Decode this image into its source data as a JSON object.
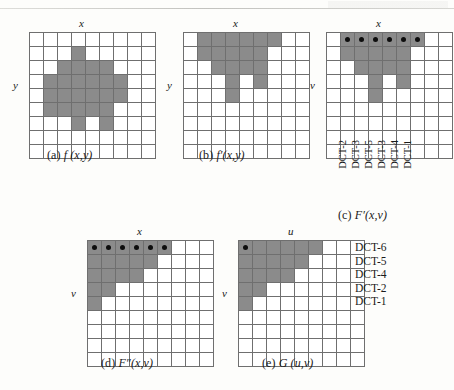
{
  "figure": {
    "fill_color": "#8b8b8b",
    "grid_line_color": "#6f6f6f",
    "dot_color": "#0d0d0d",
    "panels": [
      {
        "id": "a",
        "caption_label": "(a)",
        "caption_expr": "f (x,y)",
        "x_axis_label": "x",
        "y_axis_label": "y",
        "cols": 9,
        "rows": 9,
        "filled": [
          [
            3
          ],
          [
            2,
            3,
            4,
            5
          ],
          [
            1,
            2,
            3,
            4,
            5,
            6
          ],
          [
            1,
            2,
            3,
            4,
            5,
            6
          ],
          [
            1,
            2,
            3,
            4,
            5
          ],
          [
            3,
            5
          ]
        ],
        "filled_row_offset": 1,
        "dots": []
      },
      {
        "id": "b",
        "caption_label": "(b)",
        "caption_expr": "f′(x,y)",
        "x_axis_label": "x",
        "y_axis_label": "y",
        "cols": 9,
        "rows": 9,
        "filled": [
          [
            1,
            2,
            3,
            4,
            5,
            6
          ],
          [
            1,
            2,
            3,
            4,
            5
          ],
          [
            2,
            3,
            4,
            5
          ],
          [
            3,
            5
          ],
          [
            3
          ]
        ],
        "filled_row_offset": 0,
        "dots": []
      },
      {
        "id": "c",
        "caption_label": "(c)",
        "caption_expr": "F′(x,v)",
        "x_axis_label": "x",
        "y_axis_label": "v",
        "cols": 9,
        "rows": 9,
        "filled": [
          [
            1,
            2,
            3,
            4,
            5,
            6
          ],
          [
            1,
            2,
            3,
            4,
            5
          ],
          [
            2,
            3,
            4,
            5
          ],
          [
            3,
            5
          ],
          [
            3
          ]
        ],
        "filled_row_offset": 0,
        "dots": [
          [
            0,
            1
          ],
          [
            0,
            2
          ],
          [
            0,
            3
          ],
          [
            0,
            4
          ],
          [
            0,
            5
          ],
          [
            0,
            6
          ]
        ],
        "tick_labels": [
          "DCT-2",
          "DCT-3",
          "DCT-5",
          "DCT-3",
          "DCT-4",
          "DCT-1"
        ]
      },
      {
        "id": "d",
        "caption_label": "(d)",
        "caption_expr": "F″(x,v)",
        "x_axis_label": "x",
        "y_axis_label": "v",
        "cols": 9,
        "rows": 9,
        "filled": [
          [
            0,
            1,
            2,
            3,
            4,
            5
          ],
          [
            0,
            1,
            2,
            3,
            4
          ],
          [
            0,
            1,
            2,
            3
          ],
          [
            0,
            1
          ],
          [
            0
          ]
        ],
        "filled_row_offset": 0,
        "dots": [
          [
            0,
            0
          ],
          [
            0,
            1
          ],
          [
            0,
            2
          ],
          [
            0,
            3
          ],
          [
            0,
            4
          ],
          [
            0,
            5
          ]
        ]
      },
      {
        "id": "e",
        "caption_label": "(e)",
        "caption_expr": "G (u,v)",
        "x_axis_label": "u",
        "y_axis_label": "v",
        "cols": 9,
        "rows": 9,
        "filled": [
          [
            0,
            1,
            2,
            3,
            4,
            5
          ],
          [
            0,
            1,
            2,
            3,
            4
          ],
          [
            0,
            1,
            2,
            3
          ],
          [
            0,
            1
          ],
          [
            0
          ]
        ],
        "filled_row_offset": 0,
        "dots": [
          [
            0,
            0
          ]
        ]
      }
    ],
    "legend_labels": [
      "DCT-6",
      "DCT-5",
      "DCT-4",
      "DCT-2",
      "DCT-1"
    ]
  }
}
